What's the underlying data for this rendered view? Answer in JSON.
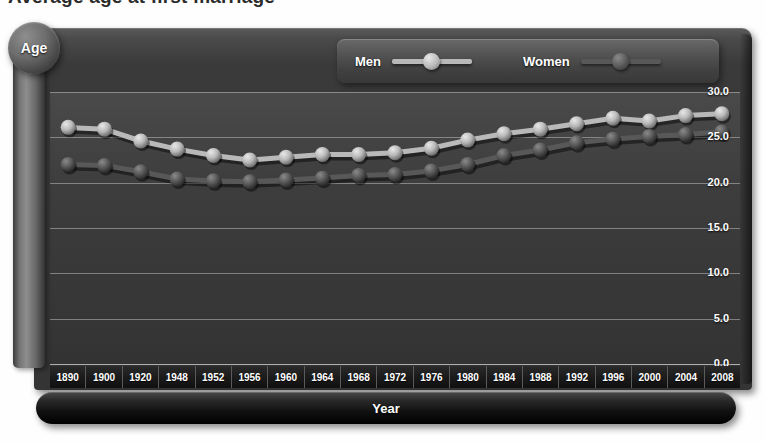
{
  "title": "Average age at first marriage",
  "axes": {
    "y_badge": "Age",
    "x_title": "Year",
    "y_ticks": [
      "30.0",
      "25.0",
      "20.0",
      "15.0",
      "10.0",
      "5.0",
      "0.0"
    ]
  },
  "legend": {
    "items": [
      {
        "label": "Men",
        "color": "#b9b9b9",
        "marker": "sphere-marker-light"
      },
      {
        "label": "Women",
        "color": "#585858",
        "marker": "sphere-marker-dark"
      }
    ]
  },
  "chart_data": {
    "type": "line",
    "title": "Average age at first marriage",
    "xlabel": "Year",
    "ylabel": "Age",
    "ylim": [
      0,
      30
    ],
    "yticks": [
      0,
      5,
      10,
      15,
      20,
      25,
      30
    ],
    "grid": true,
    "legend_position": "top-right",
    "categories": [
      "1890",
      "1900",
      "1920",
      "1948",
      "1952",
      "1956",
      "1960",
      "1964",
      "1968",
      "1972",
      "1976",
      "1980",
      "1984",
      "1988",
      "1992",
      "1996",
      "2000",
      "2004",
      "2008"
    ],
    "series": [
      {
        "name": "Men",
        "color": "#b9b9b9",
        "values": [
          26.1,
          25.9,
          24.6,
          23.7,
          23.0,
          22.5,
          22.8,
          23.1,
          23.1,
          23.3,
          23.8,
          24.7,
          25.4,
          25.9,
          26.5,
          27.1,
          26.8,
          27.4,
          27.6
        ]
      },
      {
        "name": "Women",
        "color": "#585858",
        "values": [
          22.0,
          21.9,
          21.2,
          20.4,
          20.2,
          20.1,
          20.3,
          20.5,
          20.8,
          20.9,
          21.3,
          22.0,
          23.0,
          23.6,
          24.4,
          24.8,
          25.1,
          25.3,
          25.6
        ]
      }
    ]
  }
}
